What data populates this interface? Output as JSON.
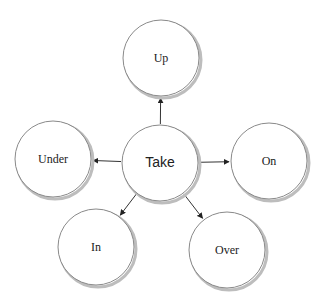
{
  "diagram": {
    "center": {
      "label": "Take",
      "cx": 160,
      "cy": 163,
      "r": 38
    },
    "nodes": [
      {
        "id": "up",
        "label": "Up",
        "cx": 161,
        "cy": 58,
        "r": 38
      },
      {
        "id": "under",
        "label": "Under",
        "cx": 53,
        "cy": 159,
        "r": 38
      },
      {
        "id": "on",
        "label": "On",
        "cx": 269,
        "cy": 161,
        "r": 38
      },
      {
        "id": "in",
        "label": "In",
        "cx": 96,
        "cy": 247,
        "r": 38
      },
      {
        "id": "over",
        "label": "Over",
        "cx": 227,
        "cy": 250,
        "r": 38
      }
    ],
    "edges": [
      {
        "from": "Take",
        "to": "Up"
      },
      {
        "from": "Take",
        "to": "Under"
      },
      {
        "from": "Take",
        "to": "On"
      },
      {
        "from": "Take",
        "to": "In"
      },
      {
        "from": "Take",
        "to": "Over"
      }
    ],
    "colors": {
      "stroke": "#8a8a8a",
      "shadow": "#bdbdbd",
      "arrow": "#333333",
      "fill": "#ffffff"
    }
  }
}
